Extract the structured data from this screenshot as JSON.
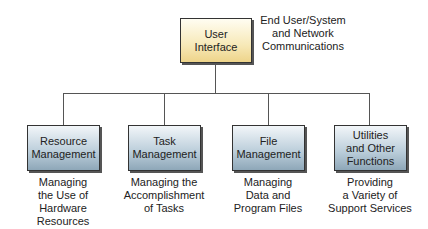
{
  "root": {
    "label": "User\nInterface",
    "description": "End User/System\nand Network\nCommunications"
  },
  "children": [
    {
      "label": "Resource\nManagement",
      "description": "Managing\nthe Use of\nHardware\nResources"
    },
    {
      "label": "Task\nManagement",
      "description": "Managing the\nAccomplishment\nof Tasks"
    },
    {
      "label": "File\nManagement",
      "description": "Managing\nData and\nProgram Files"
    },
    {
      "label": "Utilities\nand Other\nFunctions",
      "description": "Providing\na Variety of\nSupport Services"
    }
  ],
  "colors": {
    "root_fill": "#f7e9b8",
    "child_fill": "#b9ccd9",
    "line": "#555555"
  }
}
